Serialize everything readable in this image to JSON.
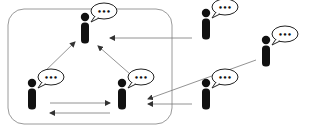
{
  "diagram": {
    "title": "",
    "group_box": {
      "x": 8,
      "y": 9,
      "w": 164,
      "h": 115,
      "r": 16,
      "stroke": "#9a9a9a"
    },
    "colors": {
      "person": "#111111",
      "bubble_stroke": "#222222",
      "arrow": "#777777",
      "background": "#ffffff"
    },
    "people": [
      {
        "id": "top-center",
        "x": 85,
        "y": 26,
        "bubble": "•••",
        "in_group": true
      },
      {
        "id": "bottom-left",
        "x": 32,
        "y": 92,
        "bubble": "•••",
        "in_group": true
      },
      {
        "id": "bottom-right",
        "x": 122,
        "y": 92,
        "bubble": "•••",
        "in_group": true
      },
      {
        "id": "outside-top",
        "x": 206,
        "y": 22,
        "bubble": "•••",
        "in_group": false
      },
      {
        "id": "outside-right",
        "x": 266,
        "y": 49,
        "bubble": "•••",
        "in_group": false
      },
      {
        "id": "outside-bottom",
        "x": 206,
        "y": 92,
        "bubble": "•••",
        "in_group": false
      }
    ],
    "edges": [
      {
        "from": "bottom-left",
        "to": "top-center",
        "x1": 40,
        "y1": 76,
        "x2": 75,
        "y2": 42
      },
      {
        "from": "bottom-right",
        "to": "top-center",
        "x1": 130,
        "y1": 74,
        "x2": 98,
        "y2": 46
      },
      {
        "from": "bottom-left",
        "to": "bottom-right",
        "x1": 50,
        "y1": 103,
        "x2": 110,
        "y2": 103
      },
      {
        "from": "bottom-right",
        "to": "bottom-left",
        "x1": 110,
        "y1": 113,
        "x2": 50,
        "y2": 113
      },
      {
        "from": "outside-top",
        "to": "top-center",
        "x1": 192,
        "y1": 38,
        "x2": 110,
        "y2": 38
      },
      {
        "from": "outside-right",
        "to": "bottom-right",
        "x1": 256,
        "y1": 60,
        "x2": 148,
        "y2": 99
      },
      {
        "from": "outside-bottom",
        "to": "bottom-right",
        "x1": 192,
        "y1": 104,
        "x2": 148,
        "y2": 104
      }
    ]
  }
}
